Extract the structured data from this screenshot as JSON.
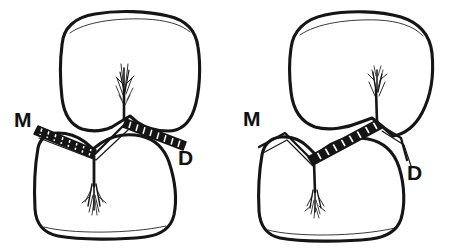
{
  "figure_set": {
    "title": "",
    "background_color": "#ffffff",
    "ink_color": "#151515",
    "panel_count": 2
  },
  "panels": [
    {
      "id": "left-panel",
      "name": "broad-contact-area-diagram",
      "labels": {
        "mesial": "M",
        "distal": "D"
      },
      "contact_bands": [
        {
          "name": "mesial-contact-band",
          "side": "left",
          "hatching": "cross-hatched"
        },
        {
          "name": "distal-contact-band",
          "side": "right",
          "hatching": "cross-hatched"
        }
      ],
      "teeth": [
        {
          "name": "upper-tooth",
          "shape": "rounded-square"
        },
        {
          "name": "lower-tooth",
          "shape": "rounded-square"
        }
      ],
      "embrasure_strokes": [
        {
          "name": "upper-embrasure-striations"
        },
        {
          "name": "lower-embrasure-striations"
        }
      ]
    },
    {
      "id": "right-panel",
      "name": "narrow-contact-area-diagram",
      "labels": {
        "mesial": "M",
        "distal": "D"
      },
      "contact_bands": [
        {
          "name": "single-contact-band",
          "side": "center",
          "hatching": "cross-hatched"
        }
      ],
      "teeth": [
        {
          "name": "upper-tooth",
          "shape": "rounded-pointed"
        },
        {
          "name": "lower-tooth",
          "shape": "rounded-square"
        }
      ],
      "embrasure_strokes": [
        {
          "name": "upper-embrasure-striations"
        },
        {
          "name": "lower-embrasure-striations"
        }
      ]
    }
  ]
}
